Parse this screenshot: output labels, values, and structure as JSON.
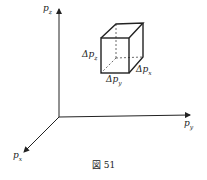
{
  "diagram": {
    "axes": {
      "z_label": "p",
      "z_sub": "z",
      "y_label": "p",
      "y_sub": "y",
      "x_label": "p",
      "x_sub": "x"
    },
    "cube": {
      "dz_label": "Δp",
      "dz_sub": "z",
      "dy_label": "Δp",
      "dy_sub": "y",
      "dx_label": "Δp",
      "dx_sub": "x"
    },
    "caption": "図 51",
    "colors": {
      "line": "#222222",
      "background": "#ffffff"
    }
  }
}
